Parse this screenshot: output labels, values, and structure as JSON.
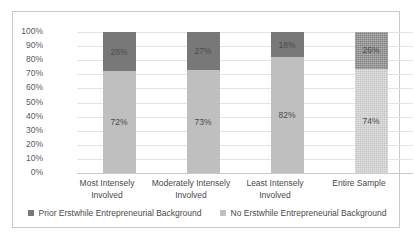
{
  "chart_data": {
    "type": "bar",
    "subtype": "100% stacked column",
    "title": "",
    "xlabel": "",
    "ylabel": "",
    "ylim": [
      0,
      100
    ],
    "grid": true,
    "legend_position": "bottom",
    "categories": [
      "Most Intensely Involved",
      "Moderately Intensely Involved",
      "Least Intensely Involved",
      "Entire Sample"
    ],
    "category_lines": [
      [
        "Most Intensely",
        "Involved"
      ],
      [
        "Moderately Intensely",
        "Involved"
      ],
      [
        "Least Intensely",
        "Involved"
      ],
      [
        "Entire Sample",
        ""
      ]
    ],
    "series": [
      {
        "name": "No Erstwhile Entrepreneurial Background",
        "color": "#bfbfbf",
        "values": [
          72,
          73,
          82,
          74
        ],
        "labels": [
          "72%",
          "73%",
          "82%",
          "74%"
        ]
      },
      {
        "name": "Prior Erstwhile Entrepreneurial Background",
        "color": "#787878",
        "values": [
          28,
          27,
          18,
          26
        ],
        "labels": [
          "28%",
          "27%",
          "18%",
          "26%"
        ]
      }
    ],
    "ytick_labels": [
      "100%",
      "90%",
      "80%",
      "70%",
      "60%",
      "50%",
      "40%",
      "30%",
      "20%",
      "10%",
      "0%"
    ],
    "ytick_values": [
      100,
      90,
      80,
      70,
      60,
      50,
      40,
      30,
      20,
      10,
      0
    ]
  },
  "legend": {
    "items": [
      {
        "label": "Prior Erstwhile Entrepreneurial Background",
        "color": "#787878"
      },
      {
        "label": "No Erstwhile Entrepreneurial Background",
        "color": "#bfbfbf"
      }
    ]
  },
  "colors": {
    "prior": "#787878",
    "no": "#bfbfbf",
    "gridline": "#e4e4e4",
    "axis": "#c9c9c9",
    "text": "#4a4a4c",
    "frame": "#c9c9c9",
    "background": "#ffffff"
  }
}
